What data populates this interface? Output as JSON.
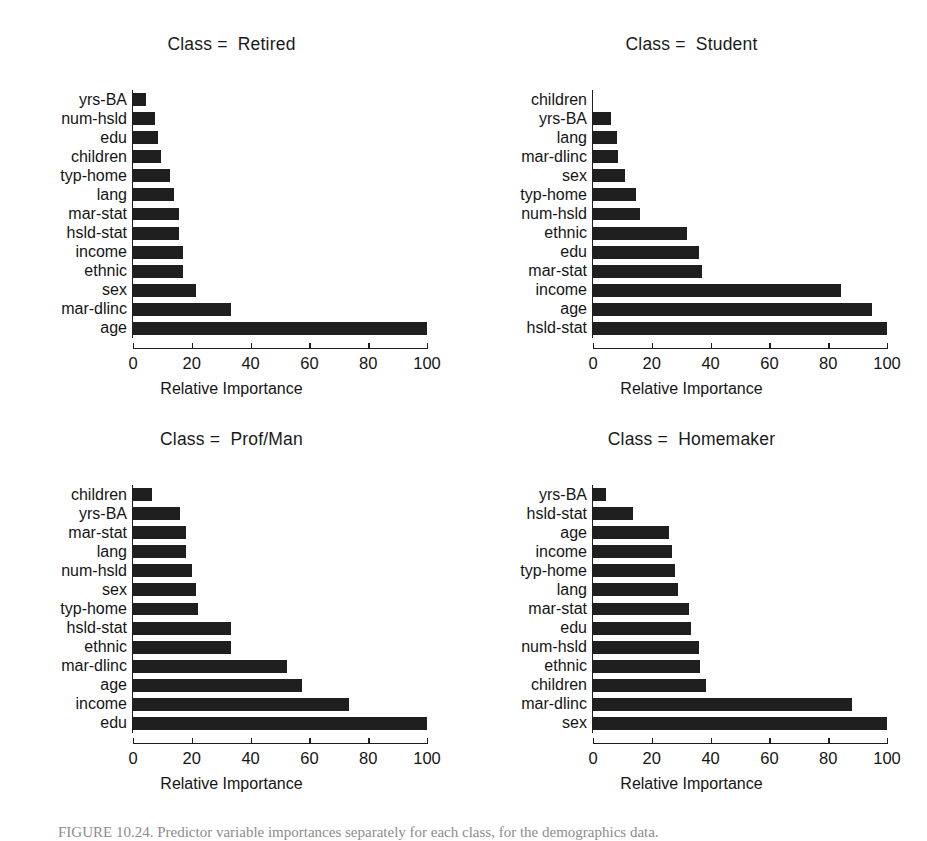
{
  "figure": {
    "caption": "FIGURE 10.24. Predictor variable importances separately for each class, for the demographics data.",
    "bar_color": "#1f1f1f",
    "axis_color": "#1d1d1d"
  },
  "axis": {
    "xlabel": "Relative Importance",
    "ticks": [
      0,
      20,
      40,
      60,
      80,
      100
    ],
    "tick_labels": [
      "0",
      "20",
      "40",
      "60",
      "80",
      "100"
    ],
    "xlim": [
      0,
      100
    ]
  },
  "chart_data": [
    {
      "type": "bar",
      "orientation": "horizontal",
      "title": "Class =  Retired",
      "xlabel": "Relative Importance",
      "ylabel": "",
      "xlim": [
        0,
        100
      ],
      "grid": false,
      "legend": "none",
      "categories": [
        "yrs-BA",
        "num-hsld",
        "edu",
        "children",
        "typ-home",
        "lang",
        "mar-stat",
        "hsld-stat",
        "income",
        "ethnic",
        "sex",
        "mar-dlinc",
        "age"
      ],
      "values": [
        4.5,
        7.5,
        8.5,
        9.5,
        12.5,
        14.0,
        15.5,
        15.5,
        17.0,
        17.0,
        21.5,
        33.5,
        100.0
      ]
    },
    {
      "type": "bar",
      "orientation": "horizontal",
      "title": "Class =  Student",
      "xlabel": "Relative Importance",
      "ylabel": "",
      "xlim": [
        0,
        100
      ],
      "grid": false,
      "legend": "none",
      "categories": [
        "children",
        "yrs-BA",
        "lang",
        "mar-dlinc",
        "sex",
        "typ-home",
        "num-hsld",
        "ethnic",
        "edu",
        "mar-stat",
        "income",
        "age",
        "hsld-stat"
      ],
      "values": [
        0.0,
        6.0,
        8.0,
        8.5,
        11.0,
        14.5,
        16.0,
        32.0,
        36.0,
        37.0,
        84.5,
        95.0,
        100.0
      ]
    },
    {
      "type": "bar",
      "orientation": "horizontal",
      "title": "Class =  Prof/Man",
      "xlabel": "Relative Importance",
      "ylabel": "",
      "xlim": [
        0,
        100
      ],
      "grid": false,
      "legend": "none",
      "categories": [
        "children",
        "yrs-BA",
        "mar-stat",
        "lang",
        "num-hsld",
        "sex",
        "typ-home",
        "hsld-stat",
        "ethnic",
        "mar-dlinc",
        "age",
        "income",
        "edu"
      ],
      "values": [
        6.5,
        16.0,
        18.0,
        18.0,
        20.0,
        21.5,
        22.0,
        33.5,
        33.5,
        52.5,
        57.5,
        73.5,
        100.0
      ]
    },
    {
      "type": "bar",
      "orientation": "horizontal",
      "title": "Class =  Homemaker",
      "xlabel": "Relative Importance",
      "ylabel": "",
      "xlim": [
        0,
        100
      ],
      "grid": false,
      "legend": "none",
      "categories": [
        "yrs-BA",
        "hsld-stat",
        "age",
        "income",
        "typ-home",
        "lang",
        "mar-stat",
        "edu",
        "num-hsld",
        "ethnic",
        "children",
        "mar-dlinc",
        "sex"
      ],
      "values": [
        4.5,
        13.5,
        26.0,
        27.0,
        28.0,
        29.0,
        32.5,
        33.5,
        36.0,
        36.5,
        38.5,
        88.0,
        100.0
      ]
    }
  ]
}
